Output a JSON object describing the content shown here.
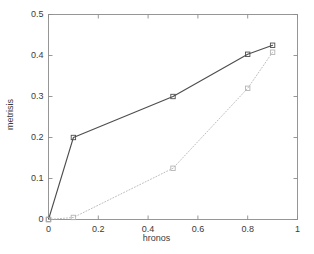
{
  "chart_data": {
    "type": "line",
    "title": "",
    "xlabel": "hronos",
    "ylabel": "metrisis",
    "xlim": [
      0,
      1
    ],
    "ylim": [
      0,
      0.5
    ],
    "xticks": [
      0,
      0.2,
      0.4,
      0.6,
      0.8,
      1
    ],
    "xticklabels": [
      "0",
      "0.2",
      "0.4",
      "0.6",
      "0.8",
      "1"
    ],
    "yticks": [
      0,
      0.1,
      0.2,
      0.3,
      0.4,
      0.5
    ],
    "yticklabels": [
      "0",
      "0.1",
      "0.2",
      "0.3",
      "0.4",
      "0.5"
    ],
    "grid": false,
    "legend": null,
    "marker": "square",
    "series": [
      {
        "name": "series-1",
        "linestyle": "solid",
        "color": "#4d4d4d",
        "marker": "square",
        "x": [
          0,
          0.1,
          0.5,
          0.8,
          0.9
        ],
        "y": [
          0,
          0.2,
          0.3,
          0.403,
          0.425
        ]
      },
      {
        "name": "series-2",
        "linestyle": "dotted",
        "color": "#b4b4b4",
        "marker": "square",
        "x": [
          0,
          0.1,
          0.5,
          0.8,
          0.9
        ],
        "y": [
          0,
          0.005,
          0.125,
          0.32,
          0.408
        ]
      }
    ]
  },
  "axes": {
    "box_color": "#8c8c8c",
    "tick_color": "#8c8c8c"
  }
}
